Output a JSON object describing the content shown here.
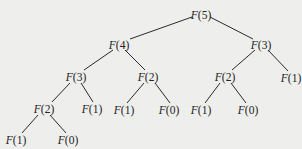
{
  "diagram": {
    "type": "recursion-tree",
    "background": "#eeeeec",
    "nodes": [
      {
        "id": "n0",
        "label": "F(5)",
        "fn": "F",
        "arg": "5",
        "x": 201,
        "y": 15
      },
      {
        "id": "n1",
        "label": "F(4)",
        "fn": "F",
        "arg": "4",
        "x": 119,
        "y": 45
      },
      {
        "id": "n2",
        "label": "F(3)",
        "fn": "F",
        "arg": "3",
        "x": 261,
        "y": 45
      },
      {
        "id": "n3",
        "label": "F(3)",
        "fn": "F",
        "arg": "3",
        "x": 76,
        "y": 77
      },
      {
        "id": "n4",
        "label": "F(2)",
        "fn": "F",
        "arg": "2",
        "x": 148,
        "y": 77
      },
      {
        "id": "n5",
        "label": "F(2)",
        "fn": "F",
        "arg": "2",
        "x": 225,
        "y": 77
      },
      {
        "id": "n6",
        "label": "F(1)",
        "fn": "F",
        "arg": "1",
        "x": 291,
        "y": 78
      },
      {
        "id": "n7",
        "label": "F(2)",
        "fn": "F",
        "arg": "2",
        "x": 44,
        "y": 109
      },
      {
        "id": "n8",
        "label": "F(1)",
        "fn": "F",
        "arg": "1",
        "x": 92,
        "y": 109
      },
      {
        "id": "n9",
        "label": "F(1)",
        "fn": "F",
        "arg": "1",
        "x": 124,
        "y": 110
      },
      {
        "id": "n10",
        "label": "F(0)",
        "fn": "F",
        "arg": "0",
        "x": 169,
        "y": 110
      },
      {
        "id": "n11",
        "label": "F(1)",
        "fn": "F",
        "arg": "1",
        "x": 201,
        "y": 110
      },
      {
        "id": "n12",
        "label": "F(0)",
        "fn": "F",
        "arg": "0",
        "x": 248,
        "y": 110
      },
      {
        "id": "n13",
        "label": "F(1)",
        "fn": "F",
        "arg": "1",
        "x": 16,
        "y": 140
      },
      {
        "id": "n14",
        "label": "F(0)",
        "fn": "F",
        "arg": "0",
        "x": 68,
        "y": 140
      }
    ],
    "edges": [
      {
        "from": "n0",
        "to": "n1",
        "x1": 192,
        "y1": 17,
        "x2": 130,
        "y2": 39
      },
      {
        "from": "n0",
        "to": "n2",
        "x1": 210,
        "y1": 17,
        "x2": 253,
        "y2": 39
      },
      {
        "from": "n1",
        "to": "n3",
        "x1": 113,
        "y1": 50,
        "x2": 84,
        "y2": 70
      },
      {
        "from": "n1",
        "to": "n4",
        "x1": 125,
        "y1": 50,
        "x2": 145,
        "y2": 70
      },
      {
        "from": "n2",
        "to": "n5",
        "x1": 255,
        "y1": 50,
        "x2": 232,
        "y2": 70
      },
      {
        "from": "n2",
        "to": "n6",
        "x1": 268,
        "y1": 50,
        "x2": 288,
        "y2": 71
      },
      {
        "from": "n3",
        "to": "n7",
        "x1": 70,
        "y1": 83,
        "x2": 52,
        "y2": 102
      },
      {
        "from": "n3",
        "to": "n8",
        "x1": 81,
        "y1": 83,
        "x2": 93,
        "y2": 102
      },
      {
        "from": "n4",
        "to": "n9",
        "x1": 144,
        "y1": 83,
        "x2": 127,
        "y2": 103
      },
      {
        "from": "n4",
        "to": "n10",
        "x1": 155,
        "y1": 83,
        "x2": 170,
        "y2": 103
      },
      {
        "from": "n5",
        "to": "n11",
        "x1": 220,
        "y1": 83,
        "x2": 205,
        "y2": 103
      },
      {
        "from": "n5",
        "to": "n12",
        "x1": 231,
        "y1": 83,
        "x2": 246,
        "y2": 103
      },
      {
        "from": "n7",
        "to": "n13",
        "x1": 38,
        "y1": 115,
        "x2": 22,
        "y2": 133
      },
      {
        "from": "n7",
        "to": "n14",
        "x1": 50,
        "y1": 115,
        "x2": 66,
        "y2": 133
      }
    ]
  }
}
